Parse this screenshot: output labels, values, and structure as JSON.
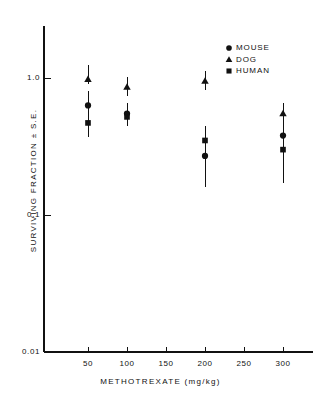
{
  "chart_data": {
    "type": "scatter",
    "title": "",
    "xlabel": "METHOTREXATE  (mg/kg)",
    "ylabel": "SURVIVING FRACTION ± S.E.",
    "yscale": "log",
    "xscale": "linear",
    "xlim": [
      0,
      330
    ],
    "ylim": [
      0.01,
      1.6
    ],
    "grid": false,
    "legend_position": "top-right",
    "xticks": [
      50,
      100,
      150,
      200,
      250,
      300
    ],
    "xticklabels": [
      "50",
      "100",
      "150",
      "200",
      "250",
      "300"
    ],
    "yticks": [
      1.0,
      0.1,
      0.01
    ],
    "yticklabels": [
      "1.0",
      "0.1",
      "0.01"
    ],
    "x": [
      50,
      100,
      200,
      300
    ],
    "series": [
      {
        "name": "MOUSE",
        "marker": "circle",
        "x": [
          50,
          100,
          200,
          300
        ],
        "values": [
          0.63,
          0.55,
          0.27,
          0.38
        ],
        "err_low": [
          0.5,
          0.46,
          0.16,
          0.17
        ],
        "err_high": [
          0.8,
          0.66,
          0.4,
          0.55
        ]
      },
      {
        "name": "DOG",
        "marker": "triangle",
        "x": [
          50,
          100,
          200,
          300
        ],
        "values": [
          0.98,
          0.86,
          0.95,
          0.55
        ],
        "err_low": [
          0.9,
          0.74,
          0.82,
          0.47
        ],
        "err_high": [
          1.25,
          1.02,
          1.12,
          0.66
        ]
      },
      {
        "name": "HUMAN",
        "marker": "square",
        "x": [
          50,
          100,
          200,
          300
        ],
        "values": [
          0.47,
          0.52,
          0.35,
          0.3
        ],
        "err_low": [
          0.37,
          0.45,
          0.27,
          0.23
        ],
        "err_high": [
          0.6,
          0.6,
          0.45,
          0.4
        ]
      }
    ]
  },
  "axes": {
    "x_title": "METHOTREXATE  (mg/kg)",
    "y_title": "SURVIVING FRACTION ± S.E."
  },
  "legend": {
    "entries": [
      {
        "label": "MOUSE",
        "marker": "circle"
      },
      {
        "label": "DOG",
        "marker": "triangle"
      },
      {
        "label": "HUMAN",
        "marker": "square"
      }
    ]
  },
  "colors": {
    "ink": "#111111",
    "background": "#ffffff"
  }
}
